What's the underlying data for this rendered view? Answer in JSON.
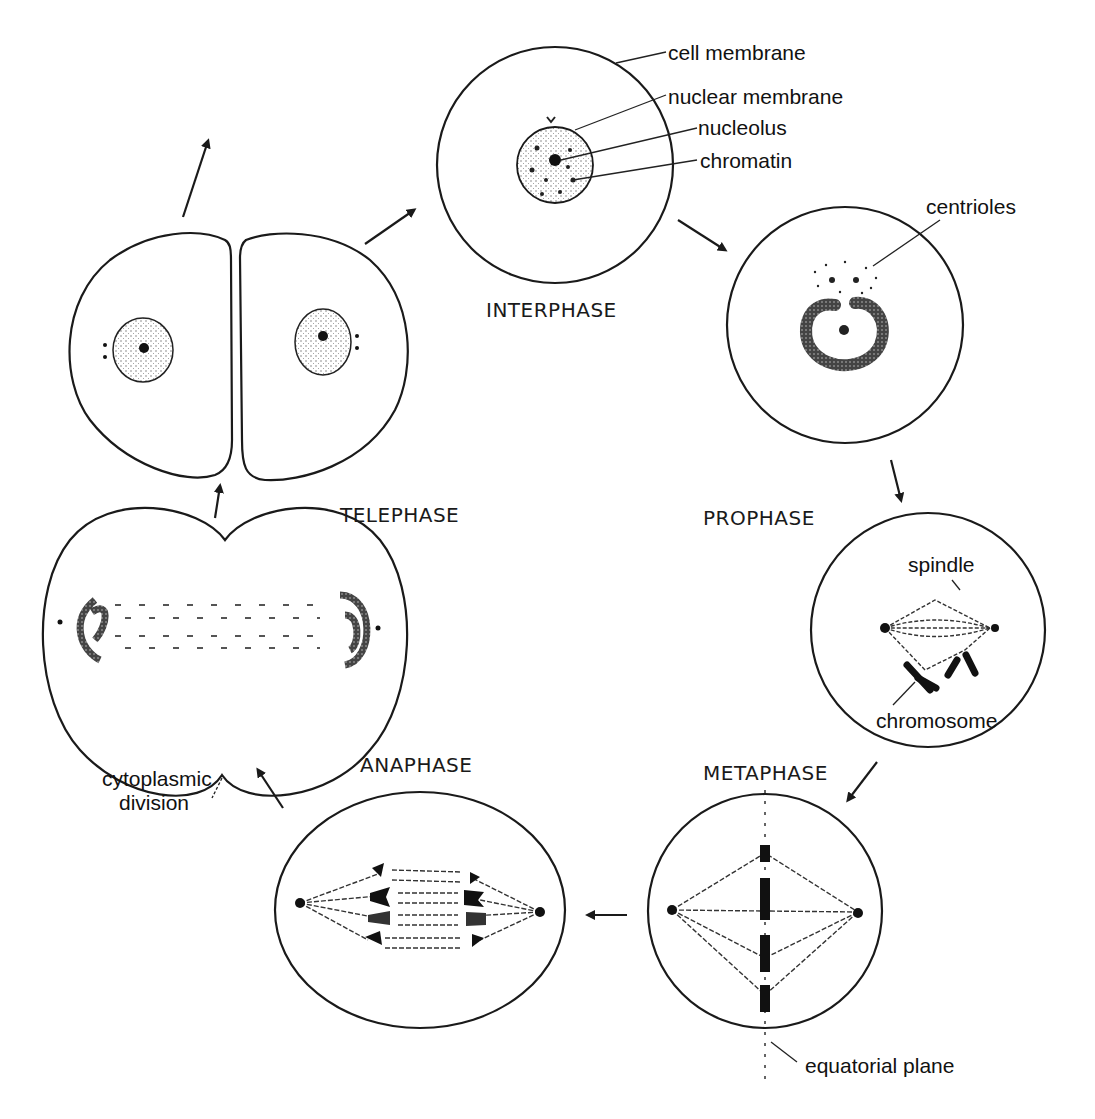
{
  "diagram": {
    "type": "cell-cycle-mitosis",
    "phases": {
      "interphase": "INTERPHASE",
      "prophase": "PROPHASE",
      "metaphase": "METAPHASE",
      "anaphase": "ANAPHASE",
      "telephase": "TELEPHASE"
    },
    "labels": {
      "cell_membrane": "cell membrane",
      "nuclear_membrane": "nuclear membrane",
      "nucleolus": "nucleolus",
      "chromatin": "chromatin",
      "centrioles": "centrioles",
      "spindle": "spindle",
      "chromosome": "chromosome",
      "equatorial_plane": "equatorial plane",
      "cytoplasmic_division_line1": "cytoplasmic",
      "cytoplasmic_division_line2": "division"
    },
    "colors": {
      "ink": "#1a1a1a",
      "background": "#ffffff",
      "stipple": "#555555"
    }
  }
}
